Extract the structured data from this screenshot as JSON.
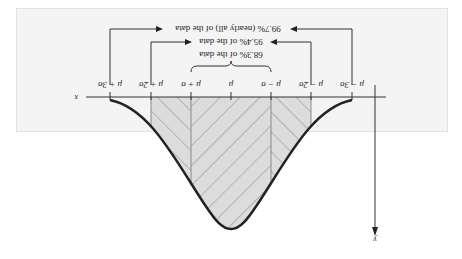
{
  "figure": {
    "orientation": "rotated-180",
    "title": "",
    "axes": {
      "x_label": "x",
      "y_label": "y"
    },
    "tick_labels": [
      "μ − 3σ",
      "μ − 2σ",
      "μ − σ",
      "μ",
      "μ + σ",
      "μ + 2σ",
      "μ + 3σ"
    ],
    "intervals": [
      {
        "label": "68.3% of the data",
        "range": "μ ± σ"
      },
      {
        "label": "95.4% of the data",
        "range": "μ ± 2σ"
      },
      {
        "label": "99.7% (nearly all) of the data",
        "range": "μ ± 3σ"
      }
    ],
    "colors": {
      "background": "#f4f4f4",
      "shade": "#dcdcdc",
      "curve": "#222222",
      "hatch": "#8a8a8a"
    }
  }
}
